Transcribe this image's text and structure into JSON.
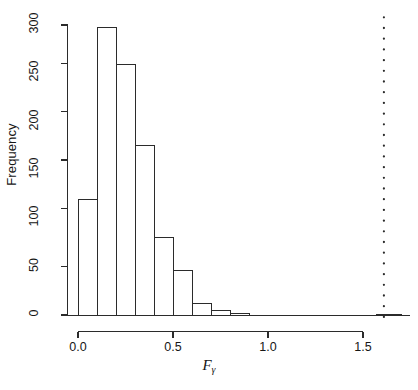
{
  "chart_data": {
    "type": "bar",
    "title": "",
    "subtitle": "",
    "xlabel": "F",
    "xlabel_sub": "γ",
    "ylabel": "Frequency",
    "xlim": [
      -0.06,
      1.72
    ],
    "ylim": [
      0,
      310
    ],
    "bin_width": 0.1,
    "grid": false,
    "legend": null,
    "xticks": [
      0.0,
      0.5,
      1.0,
      1.5
    ],
    "xtick_labels": [
      "0.0",
      "0.5",
      "1.0",
      "1.5"
    ],
    "yticks": [
      0,
      50,
      100,
      150,
      200,
      250,
      300
    ],
    "ytick_labels": [
      "0",
      "50",
      "100",
      "150",
      "200",
      "250",
      "300"
    ],
    "bin_edges": [
      0.0,
      0.1,
      0.2,
      0.3,
      0.4,
      0.5,
      0.6,
      0.7,
      0.8,
      0.9
    ],
    "categories": [
      "0.0-0.1",
      "0.1-0.2",
      "0.2-0.3",
      "0.3-0.4",
      "0.4-0.5",
      "0.5-0.6",
      "0.6-0.7",
      "0.7-0.8",
      "0.8-0.9"
    ],
    "values": [
      120,
      297,
      259,
      175,
      80,
      46,
      12,
      5,
      2
    ],
    "extra_bars": [
      {
        "x_start": 1.57,
        "x_end": 1.7,
        "value": 1,
        "label": "outlier-bin"
      }
    ],
    "annotations": [
      {
        "type": "vertical-dotted-line",
        "x": 1.61,
        "y_from": 0,
        "y_to": 308,
        "name": "threshold-line"
      }
    ],
    "bar_fill": "#ffffff",
    "bar_stroke": "#2b2b2b",
    "axis_color": "#2b2b2b",
    "background": "#ffffff"
  }
}
